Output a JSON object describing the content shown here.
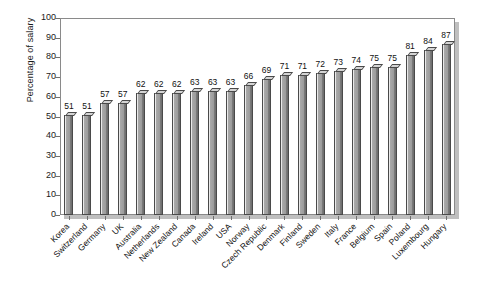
{
  "chart_data": {
    "type": "bar",
    "title": "",
    "xlabel": "",
    "ylabel": "Percentage of salary",
    "ylim": [
      0,
      100
    ],
    "ytick_step": 10,
    "yticks": [
      100,
      90,
      80,
      70,
      60,
      50,
      40,
      30,
      20,
      10,
      0
    ],
    "grid": false,
    "legend": false,
    "show_value_labels": true,
    "bar_style": "3d-column",
    "categories": [
      "Korea",
      "Switzerland",
      "Germany",
      "UK",
      "Australia",
      "Netherlands",
      "New Zealand",
      "Canada",
      "Ireland",
      "USA",
      "Norway",
      "Czech Republic",
      "Denmark",
      "Finland",
      "Sweden",
      "Italy",
      "France",
      "Belgium",
      "Spain",
      "Poland",
      "Luxembourg",
      "Hungary"
    ],
    "values": [
      51,
      51,
      57,
      57,
      62,
      62,
      62,
      63,
      63,
      63,
      66,
      69,
      71,
      71,
      72,
      73,
      74,
      75,
      75,
      81,
      84,
      87
    ]
  },
  "colors": {
    "bar_front": "#9a9a9a",
    "bar_left_face": "#e9e9e9",
    "bar_right_edge": "#6b6b6b",
    "bar_outline": "#4a4a4a",
    "bar_top": "#d4d4d4",
    "axis": "#8a8a8a",
    "tick": "#6f6f6f",
    "text": "#111111",
    "plot_background": "#ffffff",
    "frame_shadow": "#bfbfbf",
    "page_background": "#ffffff"
  }
}
